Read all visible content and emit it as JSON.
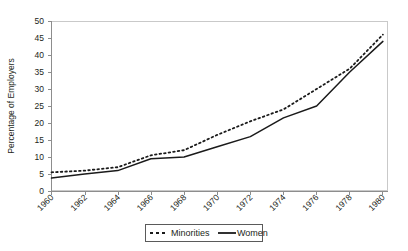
{
  "chart_data": {
    "type": "line",
    "title": "",
    "xlabel": "",
    "ylabel": "Percentage of Employers",
    "x": [
      1960,
      1962,
      1964,
      1966,
      1968,
      1970,
      1972,
      1974,
      1976,
      1978,
      1980
    ],
    "xticklabels": [
      "1960",
      "1962",
      "1964",
      "1966",
      "1968",
      "1970",
      "1972",
      "1974",
      "1976",
      "1978",
      "1980"
    ],
    "xlim": [
      1960,
      1980
    ],
    "ylim": [
      0,
      50
    ],
    "yticks": [
      0,
      5,
      10,
      15,
      20,
      25,
      30,
      35,
      40,
      45,
      50
    ],
    "yticklabels": [
      "0",
      "5",
      "10",
      "15",
      "20",
      "25",
      "30",
      "35",
      "40",
      "45",
      "50"
    ],
    "grid": false,
    "legend_position": "below-center",
    "series": [
      {
        "name": "Minorities",
        "style": "dotted",
        "color": "#1a1a1a",
        "values": [
          5.5,
          6.0,
          7.0,
          10.5,
          12.0,
          16.5,
          20.5,
          24.0,
          30.0,
          36.0,
          46.0
        ]
      },
      {
        "name": "Women",
        "style": "solid",
        "color": "#1a1a1a",
        "values": [
          3.8,
          5.0,
          6.0,
          9.5,
          10.0,
          13.0,
          16.0,
          21.5,
          25.0,
          35.0,
          44.0
        ]
      }
    ]
  },
  "legend": {
    "items": [
      {
        "label": "Minorities",
        "style": "dotted"
      },
      {
        "label": "Women",
        "style": "solid"
      }
    ]
  },
  "axes": {
    "y_title": "Percentage of Employers"
  }
}
